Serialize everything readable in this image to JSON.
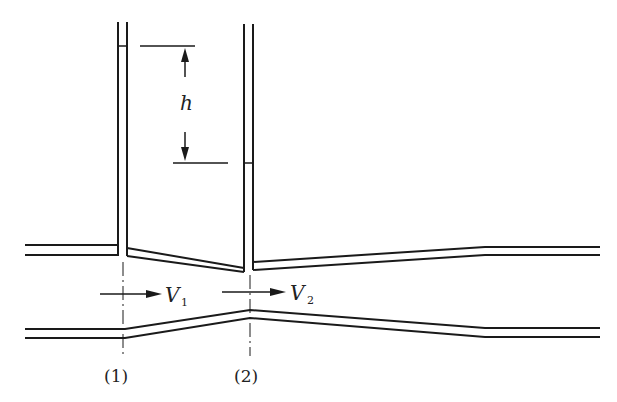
{
  "diagram": {
    "labels": {
      "head_difference": "h",
      "velocity_1": "V",
      "velocity_1_sub": "1",
      "velocity_2": "V",
      "velocity_2_sub": "2",
      "section_1": "(1)",
      "section_2": "(2)"
    },
    "colors": {
      "stroke": "#1a1a1a",
      "background": "#ffffff"
    }
  }
}
